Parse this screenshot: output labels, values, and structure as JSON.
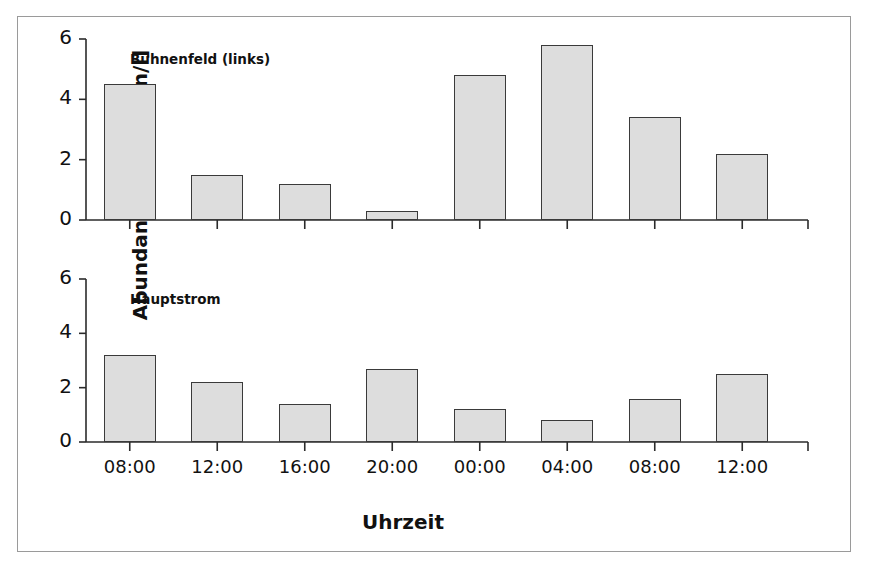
{
  "figure": {
    "x_axis_title": "Uhrzeit",
    "y_axis_title": "Abundanz [Individuen/l]"
  },
  "chart_data": [
    {
      "type": "bar",
      "title": "Buhnenfeld (links)",
      "panel": "top",
      "categories": [
        "08:00",
        "12:00",
        "16:00",
        "20:00",
        "00:00",
        "04:00",
        "08:00",
        "12:00"
      ],
      "values": [
        4.5,
        1.5,
        1.2,
        0.3,
        4.8,
        5.8,
        3.4,
        2.2
      ],
      "xlabel": "Uhrzeit",
      "ylabel": "Abundanz [Individuen/l]",
      "ylim": [
        0,
        6
      ],
      "yticks": [
        0,
        2,
        4,
        6
      ],
      "ytick_labels": [
        "0",
        "2",
        "4",
        "6"
      ],
      "grid": false,
      "legend": "none",
      "bar_fill_color": "#dddddd",
      "bar_edge_color": "#3a3a3a"
    },
    {
      "type": "bar",
      "title": "Hauptstrom",
      "panel": "bottom",
      "categories": [
        "08:00",
        "12:00",
        "16:00",
        "20:00",
        "00:00",
        "04:00",
        "08:00",
        "12:00"
      ],
      "values": [
        3.2,
        2.2,
        1.4,
        2.7,
        1.2,
        0.8,
        1.6,
        2.5
      ],
      "xlabel": "Uhrzeit",
      "ylabel": "Abundanz [Individuen/l]",
      "ylim": [
        0,
        6
      ],
      "yticks": [
        0,
        2,
        4,
        6
      ],
      "ytick_labels": [
        "0",
        "2",
        "4",
        "6"
      ],
      "grid": false,
      "legend": "none",
      "bar_fill_color": "#dddddd",
      "bar_edge_color": "#3a3a3a"
    }
  ]
}
